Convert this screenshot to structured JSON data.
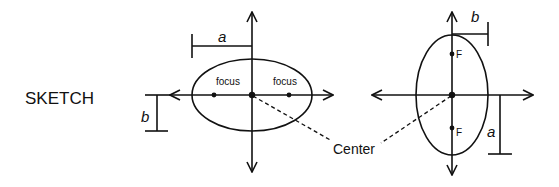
{
  "title_label": "SKETCH",
  "left_diagram": {
    "orientation": "horizontal major axis",
    "major_label": "a",
    "minor_label": "b",
    "focus_left_label": "focus",
    "focus_right_label": "focus"
  },
  "right_diagram": {
    "orientation": "vertical major axis",
    "major_label": "a",
    "minor_label": "b",
    "focus_top_label": "F",
    "focus_bottom_label": "F"
  },
  "center_label": "Center",
  "colors": {
    "ink": "#111111",
    "background": "#ffffff"
  }
}
